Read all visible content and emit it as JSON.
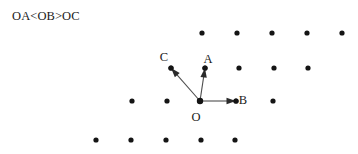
{
  "canvas": {
    "width": 358,
    "height": 154,
    "background": "#ffffff",
    "ink": "#1a1a1a",
    "dot_color": "#141414",
    "line_color": "#4d4d4d"
  },
  "title": {
    "text": "OA<OB>OC"
  },
  "diagram": {
    "type": "vector-lattice",
    "dot_radius": 2.6,
    "lattice_rows": [
      {
        "y": 33,
        "x": [
          202,
          237,
          272,
          307,
          342
        ]
      },
      {
        "y": 68,
        "x": [
          171,
          205,
          239,
          274,
          308
        ]
      },
      {
        "y": 101,
        "x": [
          132,
          167,
          200,
          236,
          273
        ]
      },
      {
        "y": 140,
        "x": [
          96,
          131,
          166,
          201,
          235
        ]
      }
    ],
    "origin": {
      "label": "O",
      "x": 200,
      "y": 101,
      "label_x": 196,
      "label_y": 118
    },
    "vectors": [
      {
        "name": "OA",
        "label": "A",
        "from_x": 200,
        "from_y": 101,
        "to_x": 205,
        "to_y": 68,
        "label_x": 208,
        "label_y": 60
      },
      {
        "name": "OB",
        "label": "B",
        "from_x": 200,
        "from_y": 101,
        "to_x": 236,
        "to_y": 101,
        "label_x": 243,
        "label_y": 101
      },
      {
        "name": "OC",
        "label": "C",
        "from_x": 200,
        "from_y": 101,
        "to_x": 171,
        "to_y": 68,
        "label_x": 164,
        "label_y": 58
      }
    ]
  }
}
